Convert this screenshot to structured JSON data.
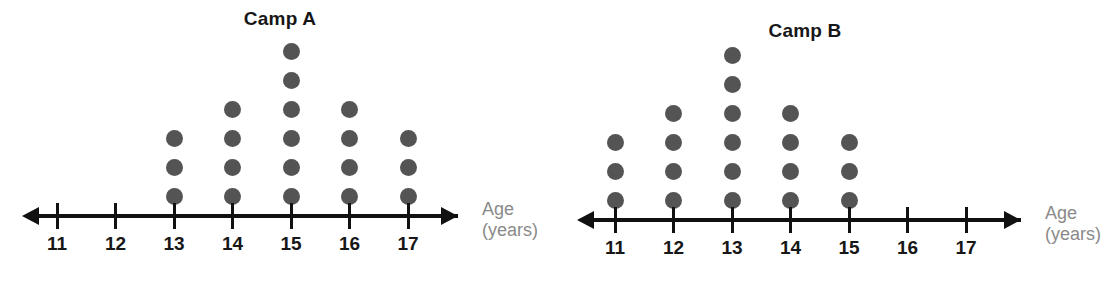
{
  "chart_data": [
    {
      "type": "dot-plot",
      "title": "Camp A",
      "xlabel": "Age",
      "xlabel_unit": "(years)",
      "ylabel": "",
      "grid": false,
      "legend": "none",
      "axis_ticks": [
        "11",
        "12",
        "13",
        "14",
        "15",
        "16",
        "17"
      ],
      "xlim": [
        11,
        17
      ],
      "categories": [
        11,
        12,
        13,
        14,
        15,
        16,
        17
      ],
      "values": [
        0,
        0,
        3,
        4,
        6,
        4,
        3
      ],
      "total": 20,
      "dot_color": "#545454",
      "axis_color": "#111111",
      "label_color": "#171717",
      "caption_color": "#8a8a8a"
    },
    {
      "type": "dot-plot",
      "title": "Camp B",
      "xlabel": "Age",
      "xlabel_unit": "(years)",
      "ylabel": "",
      "grid": false,
      "legend": "none",
      "axis_ticks": [
        "11",
        "12",
        "13",
        "14",
        "15",
        "16",
        "17"
      ],
      "xlim": [
        11,
        17
      ],
      "categories": [
        11,
        12,
        13,
        14,
        15,
        16,
        17
      ],
      "values": [
        3,
        4,
        6,
        4,
        3,
        0,
        0
      ],
      "total": 20,
      "dot_color": "#545454",
      "axis_color": "#111111",
      "label_color": "#171717",
      "caption_color": "#8a8a8a"
    }
  ]
}
